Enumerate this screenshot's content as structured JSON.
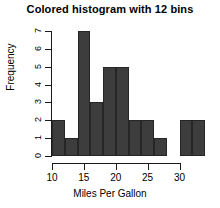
{
  "chart_data": {
    "type": "bar",
    "title": "Colored histogram with 12 bins",
    "xlabel": "Miles Per Gallon",
    "ylabel": "Frequency",
    "bin_width": 2,
    "categories": [
      "10-12",
      "12-14",
      "14-16",
      "16-18",
      "18-20",
      "20-22",
      "22-24",
      "24-26",
      "26-28",
      "28-30",
      "30-32",
      "32-34"
    ],
    "bin_edges": [
      10,
      12,
      14,
      16,
      18,
      20,
      22,
      24,
      26,
      28,
      30,
      32,
      34
    ],
    "values": [
      2,
      1,
      7,
      3,
      5,
      5,
      2,
      2,
      1,
      0,
      2,
      2
    ],
    "xlim": [
      10,
      34
    ],
    "ylim": [
      0,
      7
    ],
    "xticks": [
      10,
      15,
      20,
      25,
      30
    ],
    "yticks": [
      0,
      1,
      2,
      3,
      4,
      5,
      6,
      7
    ],
    "grid": false,
    "legend": false,
    "bar_color": "#3d3d3d",
    "bar_border_color": "#262626",
    "axis_color": "#1a1a1a",
    "background": "#ffffff"
  }
}
